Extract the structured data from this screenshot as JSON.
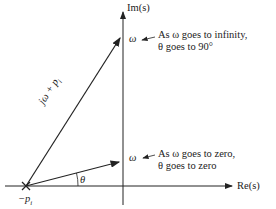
{
  "labels": {
    "im_axis": "Im(s)",
    "re_axis": "Re(s)",
    "pole": "−p",
    "pole_sub": "i",
    "vector": "jω + p",
    "vector_sub": "i",
    "omega_top": "ω",
    "omega_bottom": "ω",
    "theta": "θ",
    "note_top_line1": "As ω goes to infinity,",
    "note_top_line2": "θ goes to 90°",
    "note_bottom_line1": "As ω goes to zero,",
    "note_bottom_line2": "θ goes to zero"
  },
  "colors": {
    "line": "#222222",
    "background": "#ffffff"
  }
}
